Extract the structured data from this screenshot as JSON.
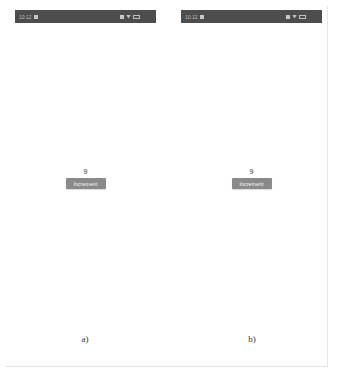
{
  "panels": [
    {
      "label": "a)",
      "status_bar": {
        "time": "10:12",
        "icons": [
          "notification-icon",
          "signal-icon",
          "wifi-icon",
          "battery-icon"
        ]
      },
      "counter_value": "9",
      "button_label": "Increment"
    },
    {
      "label": "b)",
      "status_bar": {
        "time": "10:12",
        "icons": [
          "notification-icon",
          "signal-icon",
          "wifi-icon",
          "battery-icon"
        ]
      },
      "counter_value": "9",
      "button_label": "Increment"
    }
  ],
  "colors": {
    "status_bar": "#4d4d4d",
    "button": "#8a8a8a",
    "background": "#ffffff"
  }
}
